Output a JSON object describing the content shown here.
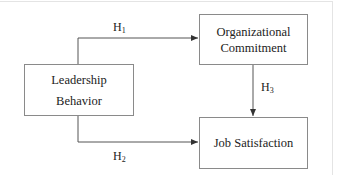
{
  "diagram": {
    "type": "path-model",
    "nodes": {
      "leadership": {
        "line1": "Leadership",
        "line2": "Behavior"
      },
      "commitment": {
        "line1": "Organizational",
        "line2": "Commitment"
      },
      "satisfaction": {
        "line1": "Job Satisfaction"
      }
    },
    "edges": [
      {
        "from": "Leadership Behavior",
        "to": "Organizational Commitment",
        "label": "H",
        "sub": "1"
      },
      {
        "from": "Leadership Behavior",
        "to": "Job Satisfaction",
        "label": "H",
        "sub": "2"
      },
      {
        "from": "Organizational Commitment",
        "to": "Job Satisfaction",
        "label": "H",
        "sub": "3"
      }
    ],
    "colors": {
      "line": "#555555",
      "box_border": "#8a8a8a"
    }
  }
}
